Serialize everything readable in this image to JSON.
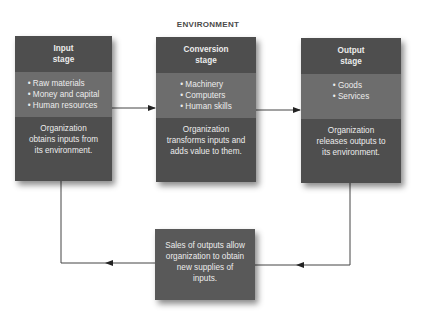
{
  "title": "ENVIRONMENT",
  "stages": [
    {
      "heading": "Input stage",
      "items": [
        "Raw materials",
        "Money and capital",
        "Human resources"
      ],
      "description": "Organization obtains inputs from its environment."
    },
    {
      "heading": "Conversion stage",
      "items": [
        "Machinery",
        "Computers",
        "Human skills"
      ],
      "description": "Organization transforms inputs and adds value to them."
    },
    {
      "heading": "Output stage",
      "items": [
        "Goods",
        "Services"
      ],
      "description": "Organization releases outputs to its environment."
    }
  ],
  "feedback": {
    "text": "Sales of outputs allow organization to obtain new supplies of inputs."
  },
  "colors": {
    "box_dark": "#4e4e4e",
    "box_light": "#6d6d6d",
    "feedback_box": "#595959",
    "text": "#ececec",
    "arrow": "#333333"
  }
}
